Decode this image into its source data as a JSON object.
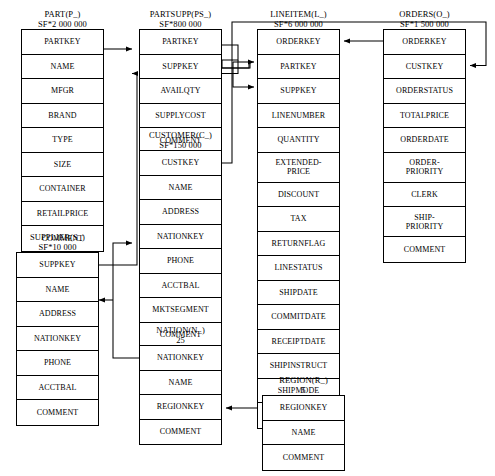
{
  "diagram": {
    "line_color": "#000000",
    "box_color": "#000000",
    "background": "#ffffff"
  },
  "tables": {
    "part": {
      "name": "PART(P_)",
      "cardinality": "SF*2 000 000",
      "columns": [
        "PARTKEY",
        "NAME",
        "MFGR",
        "BRAND",
        "TYPE",
        "SIZE",
        "CONTAINER",
        "RETAILPRICE",
        "COMMENT"
      ]
    },
    "partsupp": {
      "name": "PARTSUPP(PS_)",
      "cardinality": "SF*800 000",
      "columns": [
        "PARTKEY",
        "SUPPKEY",
        "AVAILQTY",
        "SUPPLYCOST",
        "COMMENT"
      ]
    },
    "lineitem": {
      "name": "LINEITEM(L_)",
      "cardinality": "SF*6 000 000",
      "columns": [
        "ORDERKEY",
        "PARTKEY",
        "SUPPKEY",
        "LINENUMBER",
        "QUANTITY",
        "EXTENDED-\nPRICE",
        "DISCOUNT",
        "TAX",
        "RETURNFLAG",
        "LINESTATUS",
        "SHIPDATE",
        "COMMITDATE",
        "RECEIPTDATE",
        "SHIPINSTRUCT",
        "SHIPMODE",
        "COMMENT"
      ],
      "columns_display": [
        "ORDERKEY",
        "PARTKEY",
        "SUPPKEY",
        "LINENUMBER",
        "QUANTITY",
        "EXTENDED-PRICE",
        "DISCOUNT",
        "TAX",
        "RETURNFLAG",
        "LINESTATUS",
        "SHIPDATE",
        "COMMITDATE",
        "RECEIPTDATE",
        "SHIPINSTRUCT",
        "SHIPMODE",
        "COMMENT"
      ]
    },
    "orders": {
      "name": "ORDERS(O_)",
      "cardinality": "SF*1 500 000",
      "columns": [
        "ORDERKEY",
        "CUSTKEY",
        "ORDERSTATUS",
        "TOTALPRICE",
        "ORDERDATE",
        "ORDER-PRIORITY",
        "CLERK",
        "SHIP-PRIORITY",
        "COMMENT"
      ]
    },
    "customer": {
      "name": "CUSTOMER(C_)",
      "cardinality": "SF*150 000",
      "columns": [
        "CUSTKEY",
        "NAME",
        "ADDRESS",
        "NATIONKEY",
        "PHONE",
        "ACCTBAL",
        "MKTSEGMENT",
        "COMMENT"
      ]
    },
    "supplier": {
      "name": "SUPPLIER(S_)",
      "cardinality": "SF*10 000",
      "columns": [
        "SUPPKEY",
        "NAME",
        "ADDRESS",
        "NATIONKEY",
        "PHONE",
        "ACCTBAL",
        "COMMENT"
      ]
    },
    "nation": {
      "name": "NATION(N_)",
      "cardinality": "25",
      "columns": [
        "NATIONKEY",
        "NAME",
        "REGIONKEY",
        "COMMENT"
      ]
    },
    "region": {
      "name": "REGION(R_)",
      "cardinality": "5",
      "columns": [
        "REGIONKEY",
        "NAME",
        "COMMENT"
      ]
    }
  },
  "relationships": [
    {
      "from": "PART.PARTKEY",
      "to": "PARTSUPP.PARTKEY"
    },
    {
      "from": "SUPPLIER.SUPPKEY",
      "to": "PARTSUPP.SUPPKEY"
    },
    {
      "from": "PARTSUPP.PARTKEY",
      "to": "LINEITEM.PARTKEY"
    },
    {
      "from": "PARTSUPP.SUPPKEY",
      "to": "LINEITEM.SUPPKEY"
    },
    {
      "from": "ORDERS.ORDERKEY",
      "to": "LINEITEM.ORDERKEY"
    },
    {
      "from": "CUSTOMER.CUSTKEY",
      "to": "ORDERS.CUSTKEY"
    },
    {
      "from": "NATION.NATIONKEY",
      "to": "CUSTOMER.NATIONKEY"
    },
    {
      "from": "NATION.NATIONKEY",
      "to": "SUPPLIER.NATIONKEY"
    },
    {
      "from": "REGION.REGIONKEY",
      "to": "NATION.REGIONKEY"
    }
  ]
}
